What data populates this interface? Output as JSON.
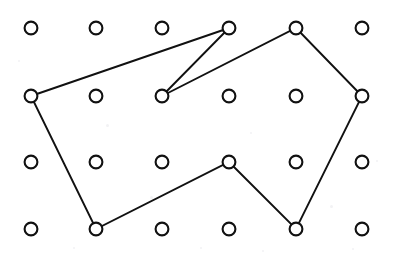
{
  "figure": {
    "kind": "geoboard-dot-grid-polygon",
    "width": 396,
    "height": 259,
    "background_color": "#ffffff",
    "ink_color": "#111111",
    "title": "",
    "caption": "",
    "labels": []
  },
  "grid": {
    "columns": 6,
    "rows": 4,
    "column_x": [
      31,
      96,
      162,
      229,
      296,
      362
    ],
    "row_y": [
      28,
      96,
      162,
      229
    ],
    "column_spacing": 66,
    "row_spacing": 67,
    "peg_radius": 6.4,
    "peg_fill": "#ffffff",
    "peg_stroke": "#111111",
    "peg_stroke_width": 2.1,
    "peg_count": 24,
    "pegs": [
      {
        "col": 0,
        "row": 0,
        "x": 31,
        "y": 28,
        "on_polygon": false
      },
      {
        "col": 1,
        "row": 0,
        "x": 96,
        "y": 28,
        "on_polygon": false
      },
      {
        "col": 2,
        "row": 0,
        "x": 162,
        "y": 28,
        "on_polygon": false
      },
      {
        "col": 3,
        "row": 0,
        "x": 229,
        "y": 28,
        "on_polygon": true
      },
      {
        "col": 4,
        "row": 0,
        "x": 296,
        "y": 28,
        "on_polygon": true
      },
      {
        "col": 5,
        "row": 0,
        "x": 362,
        "y": 28,
        "on_polygon": false
      },
      {
        "col": 0,
        "row": 1,
        "x": 31,
        "y": 96,
        "on_polygon": true
      },
      {
        "col": 1,
        "row": 1,
        "x": 96,
        "y": 96,
        "on_polygon": false
      },
      {
        "col": 2,
        "row": 1,
        "x": 162,
        "y": 96,
        "on_polygon": true
      },
      {
        "col": 3,
        "row": 1,
        "x": 229,
        "y": 96,
        "on_polygon": false
      },
      {
        "col": 4,
        "row": 1,
        "x": 296,
        "y": 96,
        "on_polygon": false
      },
      {
        "col": 5,
        "row": 1,
        "x": 362,
        "y": 96,
        "on_polygon": true
      },
      {
        "col": 0,
        "row": 2,
        "x": 31,
        "y": 162,
        "on_polygon": false
      },
      {
        "col": 1,
        "row": 2,
        "x": 96,
        "y": 162,
        "on_polygon": false
      },
      {
        "col": 2,
        "row": 2,
        "x": 162,
        "y": 162,
        "on_polygon": false
      },
      {
        "col": 3,
        "row": 2,
        "x": 229,
        "y": 162,
        "on_polygon": true
      },
      {
        "col": 4,
        "row": 2,
        "x": 296,
        "y": 162,
        "on_polygon": false
      },
      {
        "col": 5,
        "row": 2,
        "x": 362,
        "y": 162,
        "on_polygon": false
      },
      {
        "col": 0,
        "row": 3,
        "x": 31,
        "y": 229,
        "on_polygon": false
      },
      {
        "col": 1,
        "row": 3,
        "x": 96,
        "y": 229,
        "on_polygon": true
      },
      {
        "col": 2,
        "row": 3,
        "x": 162,
        "y": 229,
        "on_polygon": false
      },
      {
        "col": 3,
        "row": 3,
        "x": 229,
        "y": 229,
        "on_polygon": false
      },
      {
        "col": 4,
        "row": 3,
        "x": 296,
        "y": 229,
        "on_polygon": true
      },
      {
        "col": 5,
        "row": 3,
        "x": 362,
        "y": 229,
        "on_polygon": false
      }
    ]
  },
  "polygon": {
    "name": "geoboard-polygon",
    "closed": true,
    "vertex_count": 8,
    "stroke": "#111111",
    "stroke_width": 1.9,
    "fill": "none",
    "vertices": [
      {
        "index": 0,
        "x": 31,
        "y": 96,
        "col": 0,
        "row": 1
      },
      {
        "index": 1,
        "x": 229,
        "y": 28,
        "col": 3,
        "row": 0
      },
      {
        "index": 2,
        "x": 162,
        "y": 96,
        "col": 2,
        "row": 1
      },
      {
        "index": 3,
        "x": 296,
        "y": 28,
        "col": 4,
        "row": 0
      },
      {
        "index": 4,
        "x": 362,
        "y": 96,
        "col": 5,
        "row": 1
      },
      {
        "index": 5,
        "x": 296,
        "y": 229,
        "col": 4,
        "row": 3
      },
      {
        "index": 6,
        "x": 229,
        "y": 162,
        "col": 3,
        "row": 2
      },
      {
        "index": 7,
        "x": 96,
        "y": 229,
        "col": 1,
        "row": 3
      }
    ],
    "path_d": "M 31 96 L 229 28 L 162 96 L 296 28 L 362 96 L 296 229 L 229 162 L 96 229 Z",
    "edges": [
      {
        "from": 0,
        "to": 1
      },
      {
        "from": 1,
        "to": 2
      },
      {
        "from": 2,
        "to": 3
      },
      {
        "from": 3,
        "to": 4
      },
      {
        "from": 4,
        "to": 5
      },
      {
        "from": 5,
        "to": 6
      },
      {
        "from": 6,
        "to": 7
      },
      {
        "from": 7,
        "to": 0
      }
    ]
  },
  "specks": [
    {
      "x": 106,
      "y": 124,
      "size": 3
    },
    {
      "x": 150,
      "y": 196,
      "size": 3
    },
    {
      "x": 250,
      "y": 132,
      "size": 2
    },
    {
      "x": 330,
      "y": 205,
      "size": 3
    },
    {
      "x": 73,
      "y": 247,
      "size": 2
    },
    {
      "x": 200,
      "y": 247,
      "size": 2
    },
    {
      "x": 262,
      "y": 250,
      "size": 2
    },
    {
      "x": 352,
      "y": 248,
      "size": 2
    },
    {
      "x": 18,
      "y": 60,
      "size": 2
    },
    {
      "x": 376,
      "y": 160,
      "size": 2
    }
  ]
}
